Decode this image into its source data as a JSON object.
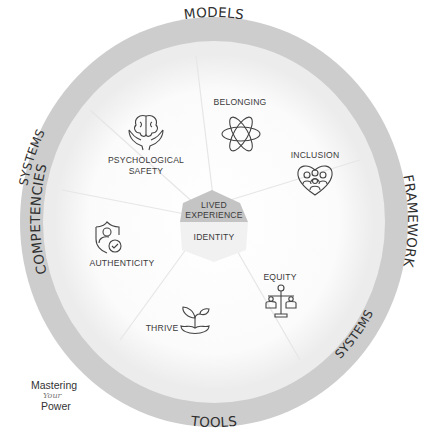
{
  "diagram": {
    "outer_ring": {
      "labels": [
        "MODELS",
        "FRAMEWORK",
        "SYSTEMS",
        "TOOLS",
        "COMPETENCIES",
        "SYSTEMS"
      ],
      "color": "#cfcfcf"
    },
    "segments": [
      {
        "label": "BELONGING",
        "icon": "atom-icon"
      },
      {
        "label": "INCLUSION",
        "icon": "heart-people-icon"
      },
      {
        "label": "EQUITY",
        "icon": "balance-scale-icon"
      },
      {
        "label": "THRIVE",
        "icon": "sprout-icon"
      },
      {
        "label": "AUTHENTICITY",
        "icon": "shield-person-check-icon"
      },
      {
        "label_line1": "PSYCHOLOGICAL",
        "label_line2": "SAFETY",
        "icon": "brain-hands-icon"
      }
    ],
    "center": {
      "top_line1": "LIVED",
      "top_line2": "EXPERIENCE",
      "bottom": "IDENTITY",
      "top_color": "#c4c4c4"
    }
  },
  "logo": {
    "line1": "Mastering",
    "line2": "Your",
    "line3": "Power"
  }
}
